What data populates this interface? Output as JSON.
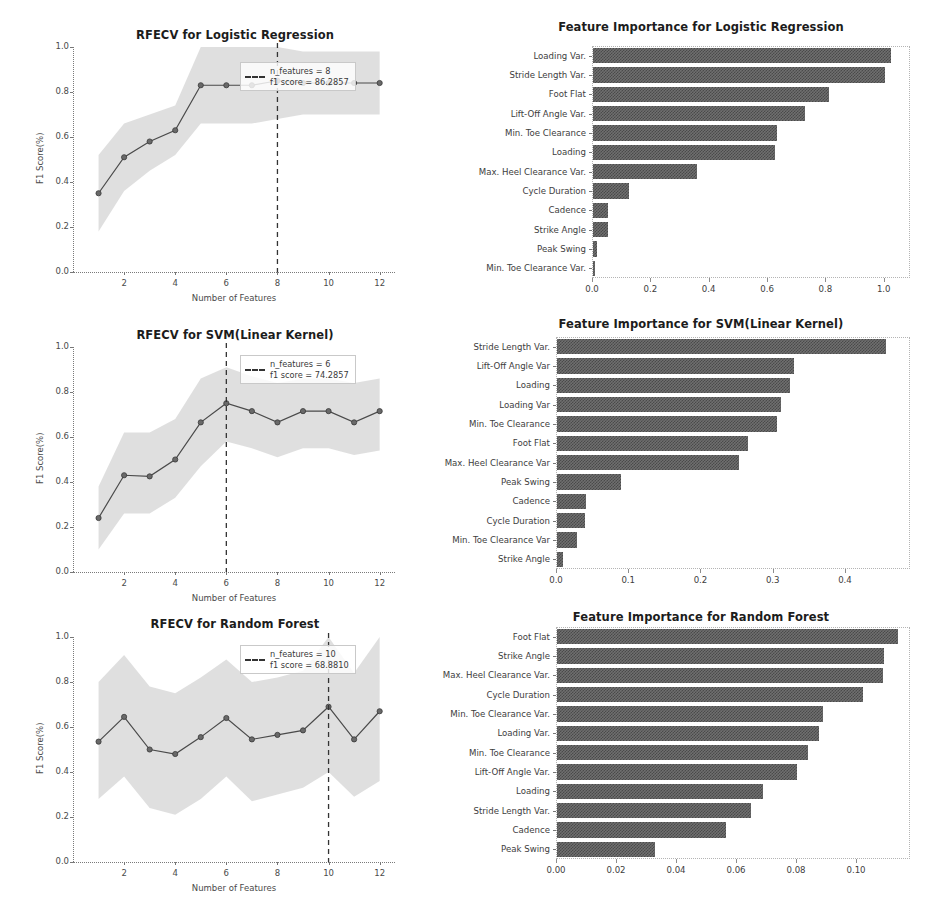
{
  "figure": {
    "width": 942,
    "height": 920,
    "background": "#ffffff",
    "bar_color": "#5a5a5a",
    "line_color": "#4a4a4a",
    "band_color": "#d9d9d9"
  },
  "panels": [
    {
      "id": "rfecv-logistic-regression",
      "title": "RFECV for Logistic Regression",
      "legend": {
        "n_features_text": "n_features = 8",
        "f1_text": "f1 score = 86.2857",
        "dash_style": "dashed"
      }
    },
    {
      "id": "feature-importance-logistic-regression",
      "title": "Feature Importance for Logistic Regression"
    },
    {
      "id": "rfecv-svm",
      "title": "RFECV for SVM(Linear Kernel)",
      "legend": {
        "n_features_text": "n_features = 6",
        "f1_text": "f1 score = 74.2857",
        "dash_style": "dashed"
      }
    },
    {
      "id": "feature-importance-svm",
      "title": "Feature Importance for SVM(Linear Kernel)"
    },
    {
      "id": "rfecv-random-forest",
      "title": "RFECV for Random Forest",
      "legend": {
        "n_features_text": "n_features = 10",
        "f1_text": "f1 score = 68.8810",
        "dash_style": "dashed"
      }
    },
    {
      "id": "feature-importance-random-forest",
      "title": "Feature Importance for Random Forest"
    }
  ],
  "chart_data": [
    {
      "type": "line",
      "id": "rfecv-logistic-regression",
      "title": "RFECV for Logistic Regression",
      "xlabel": "Number of Features",
      "ylabel": "F1 Score(%)",
      "xlim": [
        0,
        12.6
      ],
      "ylim": [
        0.0,
        1.0
      ],
      "xticks": [
        2,
        4,
        6,
        8,
        10,
        12
      ],
      "xticklabels": [
        "2",
        "4",
        "6",
        "8",
        "10",
        "12"
      ],
      "yticks": [
        0.0,
        0.2,
        0.4,
        0.6,
        0.8,
        1.0
      ],
      "yticklabels": [
        "0.0",
        "0.2",
        "0.4",
        "0.6",
        "0.8",
        "1.0"
      ],
      "grid": false,
      "legend_position": "upper right",
      "x": [
        1,
        2,
        3,
        4,
        5,
        6,
        7,
        8,
        9,
        10,
        11,
        12
      ],
      "series": [
        {
          "name": "mean f1",
          "values": [
            0.35,
            0.51,
            0.58,
            0.63,
            0.83,
            0.83,
            0.83,
            0.85,
            0.84,
            0.84,
            0.84,
            0.84
          ]
        }
      ],
      "band_upper": [
        0.52,
        0.66,
        0.7,
        0.74,
        1.0,
        1.0,
        1.0,
        1.0,
        0.98,
        0.98,
        0.98,
        0.98
      ],
      "band_lower": [
        0.18,
        0.36,
        0.45,
        0.52,
        0.66,
        0.66,
        0.66,
        0.68,
        0.7,
        0.7,
        0.7,
        0.7
      ],
      "vline": {
        "x": 8,
        "label": "n_features = 8",
        "style": "dashed"
      },
      "annotations": [
        "n_features = 8",
        "f1 score = 86.2857"
      ]
    },
    {
      "type": "bar",
      "orientation": "horizontal",
      "id": "feature-importance-logistic-regression",
      "title": "Feature Importance for Logistic Regression",
      "xlabel": "",
      "ylabel": "",
      "xlim": [
        0.0,
        1.09
      ],
      "xticks": [
        0.0,
        0.2,
        0.4,
        0.6,
        0.8,
        1.0
      ],
      "xticklabels": [
        "0.0",
        "0.2",
        "0.4",
        "0.6",
        "0.8",
        "1.0"
      ],
      "grid": false,
      "categories": [
        "Loading Var.",
        "Stride Length Var.",
        "Foot Flat",
        "Lift-Off Angle Var.",
        "Min. Toe Clearance",
        "Loading",
        "Max. Heel Clearance Var.",
        "Cycle Duration",
        "Cadence",
        "Strike Angle",
        "Peak Swing",
        "Min. Toe Clearance Var."
      ],
      "values": [
        1.02,
        1.0,
        0.81,
        0.725,
        0.63,
        0.625,
        0.355,
        0.125,
        0.05,
        0.05,
        0.012,
        0.004
      ]
    },
    {
      "type": "line",
      "id": "rfecv-svm",
      "title": "RFECV for SVM(Linear Kernel)",
      "xlabel": "Number of Features",
      "ylabel": "F1 Score(%)",
      "xlim": [
        0,
        12.6
      ],
      "ylim": [
        0.0,
        1.0
      ],
      "xticks": [
        2,
        4,
        6,
        8,
        10,
        12
      ],
      "xticklabels": [
        "2",
        "4",
        "6",
        "8",
        "10",
        "12"
      ],
      "yticks": [
        0.0,
        0.2,
        0.4,
        0.6,
        0.8,
        1.0
      ],
      "yticklabels": [
        "0.0",
        "0.2",
        "0.4",
        "0.6",
        "0.8",
        "1.0"
      ],
      "grid": false,
      "legend_position": "upper right",
      "x": [
        1,
        2,
        3,
        4,
        5,
        6,
        7,
        8,
        9,
        10,
        11,
        12
      ],
      "series": [
        {
          "name": "mean f1",
          "values": [
            0.24,
            0.43,
            0.425,
            0.5,
            0.665,
            0.75,
            0.715,
            0.665,
            0.715,
            0.715,
            0.665,
            0.715
          ]
        }
      ],
      "band_upper": [
        0.38,
        0.62,
        0.62,
        0.68,
        0.86,
        0.91,
        0.87,
        0.84,
        0.86,
        0.86,
        0.84,
        0.86
      ],
      "band_lower": [
        0.1,
        0.26,
        0.26,
        0.33,
        0.47,
        0.58,
        0.55,
        0.51,
        0.55,
        0.55,
        0.52,
        0.54
      ],
      "vline": {
        "x": 6,
        "label": "n_features = 6",
        "style": "dashed"
      },
      "annotations": [
        "n_features = 6",
        "f1 score = 74.2857"
      ]
    },
    {
      "type": "bar",
      "orientation": "horizontal",
      "id": "feature-importance-svm",
      "title": "Feature Importance for SVM(Linear Kernel)",
      "xlabel": "",
      "ylabel": "",
      "xlim": [
        0.0,
        0.49
      ],
      "xticks": [
        0.0,
        0.1,
        0.2,
        0.3,
        0.4
      ],
      "xticklabels": [
        "0.0",
        "0.1",
        "0.2",
        "0.3",
        "0.4"
      ],
      "grid": false,
      "categories": [
        "Stride Length Var.",
        "Lift-Off Angle Var",
        "Loading",
        "Loading Var",
        "Min. Toe Clearance",
        "Foot Flat",
        "Max. Heel Clearance Var",
        "Peak Swing",
        "Cadence",
        "Cycle Duration",
        "Min. Toe Clearance Var",
        "Strike Angle"
      ],
      "values": [
        0.455,
        0.328,
        0.322,
        0.31,
        0.305,
        0.265,
        0.252,
        0.088,
        0.04,
        0.039,
        0.027,
        0.008
      ]
    },
    {
      "type": "line",
      "id": "rfecv-random-forest",
      "title": "RFECV for Random Forest",
      "xlabel": "Number of Features",
      "ylabel": "F1 Score(%)",
      "xlim": [
        0,
        12.6
      ],
      "ylim": [
        0.0,
        1.0
      ],
      "xticks": [
        2,
        4,
        6,
        8,
        10,
        12
      ],
      "xticklabels": [
        "2",
        "4",
        "6",
        "8",
        "10",
        "12"
      ],
      "yticks": [
        0.0,
        0.2,
        0.4,
        0.6,
        0.8,
        1.0
      ],
      "yticklabels": [
        "0.0",
        "0.2",
        "0.4",
        "0.6",
        "0.8",
        "1.0"
      ],
      "grid": false,
      "legend_position": "upper right",
      "x": [
        1,
        2,
        3,
        4,
        5,
        6,
        7,
        8,
        9,
        10,
        11,
        12
      ],
      "series": [
        {
          "name": "mean f1",
          "values": [
            0.535,
            0.645,
            0.5,
            0.48,
            0.555,
            0.64,
            0.545,
            0.565,
            0.585,
            0.69,
            0.545,
            0.67
          ]
        }
      ],
      "band_upper": [
        0.8,
        0.92,
        0.78,
        0.75,
        0.82,
        0.9,
        0.8,
        0.82,
        0.85,
        1.0,
        0.84,
        1.0
      ],
      "band_lower": [
        0.28,
        0.38,
        0.24,
        0.21,
        0.28,
        0.38,
        0.27,
        0.3,
        0.33,
        0.4,
        0.29,
        0.36
      ],
      "vline": {
        "x": 10,
        "label": "n_features = 10",
        "style": "dashed"
      },
      "annotations": [
        "n_features = 10",
        "f1 score = 68.8810"
      ]
    },
    {
      "type": "bar",
      "orientation": "horizontal",
      "id": "feature-importance-random-forest",
      "title": "Feature Importance for Random Forest",
      "xlabel": "",
      "ylabel": "",
      "xlim": [
        0.0,
        0.118
      ],
      "xticks": [
        0.0,
        0.02,
        0.04,
        0.06,
        0.08,
        0.1
      ],
      "xticklabels": [
        "0.00",
        "0.02",
        "0.04",
        "0.06",
        "0.08",
        "0.10"
      ],
      "grid": false,
      "categories": [
        "Foot Flat",
        "Strike Angle",
        "Max. Heel Clearance Var.",
        "Cycle Duration",
        "Min. Toe Clearance Var.",
        "Loading Var.",
        "Min. Toe Clearance",
        "Lift-Off Angle Var.",
        "Loading",
        "Stride Length Var.",
        "Cadence",
        "Peak Swing"
      ],
      "values": [
        0.1135,
        0.109,
        0.1088,
        0.102,
        0.0888,
        0.0872,
        0.0835,
        0.08,
        0.0685,
        0.0648,
        0.0562,
        0.0325
      ]
    }
  ]
}
